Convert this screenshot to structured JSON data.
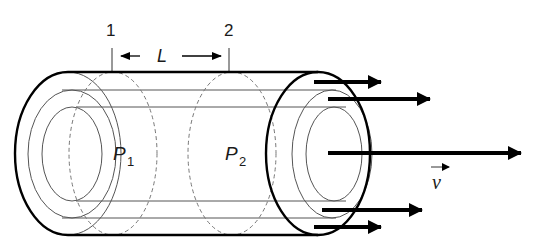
{
  "diagram": {
    "type": "pipe-flow-schematic",
    "colors": {
      "outline": "#000000",
      "thin_line": "#555555",
      "dashed": "#666666",
      "text": "#1a1a1a",
      "background": "#ffffff"
    },
    "section_labels": {
      "section_1": "1",
      "section_2": "2"
    },
    "length_label": "L",
    "pressure_labels": {
      "p1_main": "P",
      "p1_sub": "1",
      "p2_main": "P",
      "p2_sub": "2"
    },
    "velocity_label": "v",
    "velocity_vector_marker": "→",
    "flow_arrows": [
      {
        "y": 82,
        "x_end": 381
      },
      {
        "y": 99,
        "x_end": 430
      },
      {
        "y": 153,
        "x_end": 521
      },
      {
        "y": 210,
        "x_end": 422
      },
      {
        "y": 227,
        "x_end": 381
      }
    ]
  }
}
